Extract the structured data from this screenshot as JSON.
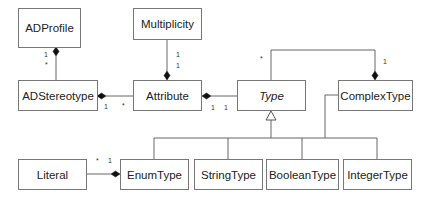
{
  "classes": {
    "adprofile": "ADProfile",
    "multiplicity": "Multiplicity",
    "adstereotype": "ADStereotype",
    "attribute": "Attribute",
    "type": "Type",
    "complextype": "ComplexType",
    "literal": "Literal",
    "enumtype": "EnumType",
    "stringtype": "StringType",
    "booleantype": "BooleanType",
    "integertype": "IntegerType"
  },
  "multiplicities": {
    "adprofile_adstereotype_top": "1",
    "adprofile_adstereotype_bottom": "*",
    "multiplicity_attribute_top": "1",
    "multiplicity_attribute_bottom": "1",
    "adstereotype_attribute_left": "1",
    "adstereotype_attribute_right": "*",
    "attribute_type_left": "1",
    "attribute_type_right": "1",
    "type_complextype_type": "*",
    "complextype_type_complex": "1",
    "literal_enum_left": "*",
    "literal_enum_right": "1"
  }
}
